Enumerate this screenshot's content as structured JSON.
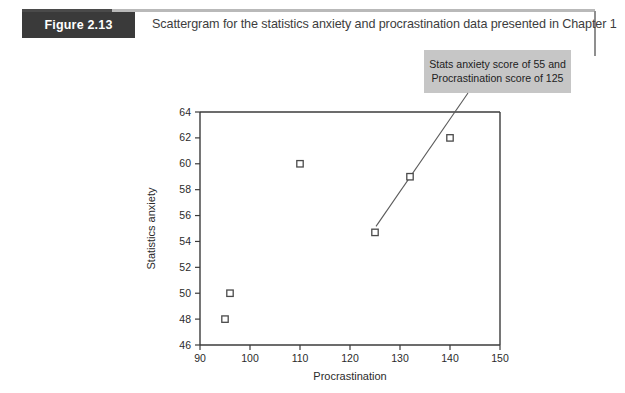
{
  "figure": {
    "tag": "Figure 2.13",
    "caption": "Scattergram for the statistics anxiety and procrastination data presented in Chapter 1"
  },
  "annotation": {
    "text": "Stats anxiety score of 55 and Procrastination score of 125",
    "points_to": {
      "x": 125,
      "y": 54.7
    },
    "background": "#c6c6c6"
  },
  "chart_data": {
    "type": "scatter",
    "title": "",
    "xlabel": "Procrastination",
    "ylabel": "Statistics anxiety",
    "xlim": [
      90,
      150
    ],
    "ylim": [
      46,
      64
    ],
    "xticks": [
      90,
      100,
      110,
      120,
      130,
      140,
      150
    ],
    "yticks": [
      46,
      48,
      50,
      52,
      54,
      56,
      58,
      60,
      62,
      64
    ],
    "grid": false,
    "legend": "none",
    "marker": "open-square",
    "series": [
      {
        "name": "Participants",
        "points": [
          {
            "x": 95,
            "y": 48
          },
          {
            "x": 96,
            "y": 50
          },
          {
            "x": 110,
            "y": 60
          },
          {
            "x": 125,
            "y": 54.7
          },
          {
            "x": 132,
            "y": 59
          },
          {
            "x": 140,
            "y": 62
          }
        ]
      }
    ]
  }
}
